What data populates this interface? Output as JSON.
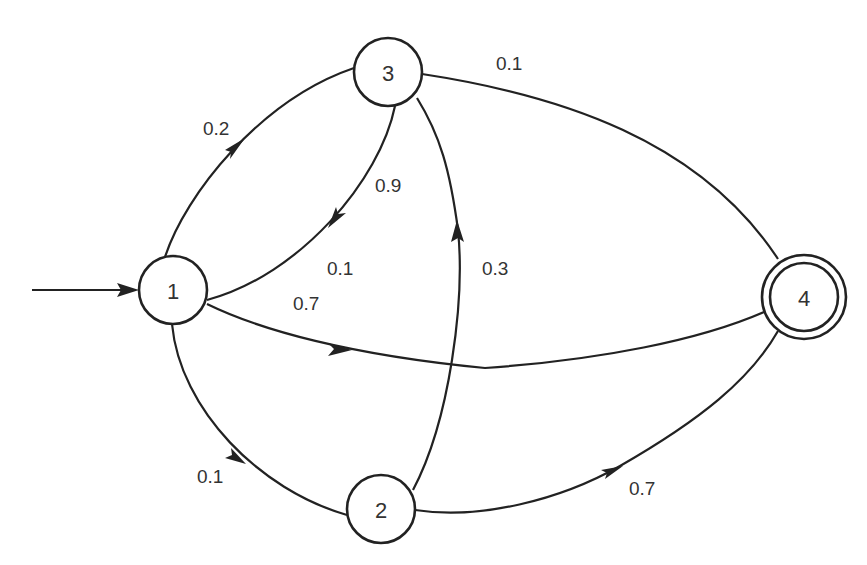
{
  "diagram": {
    "type": "probabilistic state transition diagram",
    "colors": {
      "stroke": "#222222",
      "text": "#333333",
      "background": "#ffffff"
    },
    "start_arrow": {
      "target": "1"
    },
    "nodes": [
      {
        "id": "1",
        "label": "1",
        "cx": 173,
        "cy": 290,
        "r": 34,
        "accepting": false,
        "initial": true
      },
      {
        "id": "2",
        "label": "2",
        "cx": 381,
        "cy": 509,
        "r": 34,
        "accepting": false,
        "initial": false
      },
      {
        "id": "3",
        "label": "3",
        "cx": 388,
        "cy": 72,
        "r": 34,
        "accepting": false,
        "initial": false
      },
      {
        "id": "4",
        "label": "4",
        "cx": 804,
        "cy": 297,
        "r": 42,
        "accepting": true,
        "initial": false
      }
    ],
    "edges": [
      {
        "from": "1",
        "to": "3",
        "label": "0.2"
      },
      {
        "from": "3",
        "to": "1",
        "label": "0.9"
      },
      {
        "from": "1",
        "to": "4",
        "label": "0.7"
      },
      {
        "from": "3",
        "to": "4",
        "label": "0.1"
      },
      {
        "from": "2",
        "to": "3",
        "label": "0.3"
      },
      {
        "from": "1",
        "to": "2",
        "label": "0.1"
      },
      {
        "from": "2",
        "to": "4",
        "label": "0.7"
      }
    ],
    "labels": {
      "e13": "0.2",
      "e31": "0.9",
      "e1_mid": "0.1",
      "e14": "0.7",
      "e34": "0.1",
      "e23": "0.3",
      "e12": "0.1",
      "e24": "0.7"
    },
    "node_labels": {
      "n1": "1",
      "n2": "2",
      "n3": "3",
      "n4": "4"
    }
  }
}
